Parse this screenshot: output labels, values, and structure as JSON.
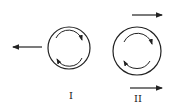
{
  "diagram": {
    "figures": [
      {
        "label": "I",
        "rotation": "clockwise",
        "translation_arrows": [
          "left"
        ]
      },
      {
        "label": "II",
        "rotation": "clockwise",
        "translation_arrows": [
          "right-top",
          "right-bottom"
        ]
      }
    ],
    "colors": {
      "stroke": "#222222",
      "background": "#ffffff"
    }
  }
}
